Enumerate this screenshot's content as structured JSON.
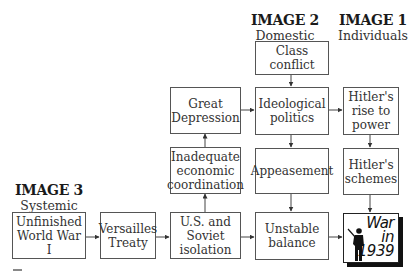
{
  "headers": {
    "image2": {
      "title": "IMAGE 2",
      "subtitle": "Domestic"
    },
    "image1": {
      "title": "IMAGE 1",
      "subtitle": "Individuals"
    },
    "image3": {
      "title": "IMAGE 3",
      "subtitle": "Systemic"
    }
  },
  "boxes": {
    "class_conflict": [
      "Class",
      "conflict"
    ],
    "great_depression": [
      "Great",
      "Depression"
    ],
    "ideological_politics": [
      "Ideological",
      "politics"
    ],
    "hitlers_rise": [
      "Hitler's",
      "rise to",
      "power"
    ],
    "inadequate_coordination": [
      "Inadequate",
      "economic",
      "coordination"
    ],
    "appeasement": [
      "Appeasement"
    ],
    "hitlers_schemes": [
      "Hitler's",
      "schemes"
    ],
    "unfinished_ww1": [
      "Unfinished",
      "World War I"
    ],
    "versailles": [
      "Versailles",
      "Treaty"
    ],
    "us_soviet_isolation": [
      "U.S. and",
      "Soviet",
      "isolation"
    ],
    "unstable_balance": [
      "Unstable",
      "balance"
    ]
  },
  "outcome": {
    "lines": [
      "War",
      "in",
      "1939"
    ],
    "icon": "soldier-silhouette-icon"
  },
  "edges": [
    {
      "from": "Class conflict",
      "to": "Ideological politics"
    },
    {
      "from": "Great Depression",
      "to": "Ideological politics"
    },
    {
      "from": "Ideological politics",
      "to": "Hitler's rise to power"
    },
    {
      "from": "Ideological politics",
      "to": "Appeasement"
    },
    {
      "from": "Hitler's rise to power",
      "to": "Hitler's schemes"
    },
    {
      "from": "Inadequate economic coordination",
      "to": "Great Depression"
    },
    {
      "from": "U.S. and Soviet isolation",
      "to": "Inadequate economic coordination"
    },
    {
      "from": "Appeasement",
      "to": "Unstable balance"
    },
    {
      "from": "Hitler's schemes",
      "to": "War in 1939"
    },
    {
      "from": "Unfinished World War I",
      "to": "Versailles Treaty"
    },
    {
      "from": "Versailles Treaty",
      "to": "U.S. and Soviet isolation"
    },
    {
      "from": "U.S. and Soviet isolation",
      "to": "Unstable balance"
    },
    {
      "from": "Unstable balance",
      "to": "War in 1939"
    }
  ]
}
